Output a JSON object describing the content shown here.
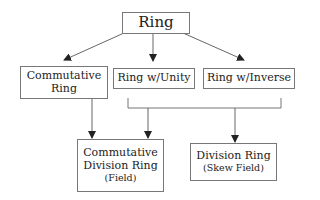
{
  "diagram": {
    "nodes": {
      "ring": {
        "lines": [
          "Ring"
        ]
      },
      "commutative_ring": {
        "lines": [
          "Commutative",
          "Ring"
        ]
      },
      "ring_unity": {
        "lines": [
          "Ring w/Unity"
        ]
      },
      "ring_inverse": {
        "lines": [
          "Ring w/Inverse"
        ]
      },
      "comm_division_ring": {
        "lines": [
          "Commutative",
          "Division Ring",
          "(Field)"
        ]
      },
      "division_ring": {
        "lines": [
          "Division Ring",
          "(Skew Field)"
        ]
      }
    },
    "edges": [
      {
        "from": "Ring",
        "to": "Commutative Ring"
      },
      {
        "from": "Ring",
        "to": "Ring w/Unity"
      },
      {
        "from": "Ring",
        "to": "Ring w/Inverse"
      },
      {
        "from": "Commutative Ring",
        "to": "Commutative Division Ring (Field)"
      },
      {
        "from": "Ring w/Unity + Ring w/Inverse",
        "to": "Commutative Division Ring (Field)"
      },
      {
        "from": "Ring w/Unity + Ring w/Inverse",
        "to": "Division Ring (Skew Field)"
      }
    ]
  }
}
